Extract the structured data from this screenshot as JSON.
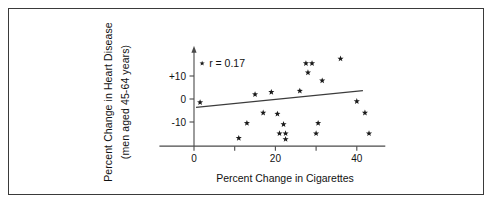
{
  "figure": {
    "xlabel": "Percent Change in Cigarettes",
    "ylabel_line1": "Percent Change in Heart Disease",
    "ylabel_line2": "(men aged 45-64 years)",
    "annotation": "r = 0.17",
    "frame_color": "#3a3a3a",
    "marker_color": "#1a1a1a",
    "axis_color": "#4a4a4a"
  },
  "chart_data": {
    "type": "scatter",
    "title": "",
    "xlabel": "Percent Change in Cigarettes",
    "ylabel": "Percent Change in Heart Disease (men aged 45-64 years)",
    "xlim": [
      -10,
      48
    ],
    "ylim": [
      -22,
      22
    ],
    "xticks": [
      0,
      10,
      20,
      30,
      40
    ],
    "xticklabels": [
      "0",
      "",
      "20",
      "",
      "40"
    ],
    "yticks": [
      -10,
      0,
      10
    ],
    "yticklabels": [
      "-10",
      "0",
      "+10"
    ],
    "grid": false,
    "legend": null,
    "annotations": [
      {
        "text": "r = 0.17",
        "x": 2,
        "y": 15.5,
        "marker": true
      }
    ],
    "series": [
      {
        "name": "countries",
        "marker": "star",
        "points": [
          {
            "x": 1.5,
            "y": -1.5
          },
          {
            "x": 11.0,
            "y": -17.0
          },
          {
            "x": 13.0,
            "y": -10.5
          },
          {
            "x": 15.0,
            "y": 2.0
          },
          {
            "x": 17.0,
            "y": -6.0
          },
          {
            "x": 19.0,
            "y": 3.0
          },
          {
            "x": 20.5,
            "y": -6.5
          },
          {
            "x": 21.0,
            "y": -15.0
          },
          {
            "x": 22.0,
            "y": -11.0
          },
          {
            "x": 22.5,
            "y": -15.0
          },
          {
            "x": 22.5,
            "y": -17.5
          },
          {
            "x": 26.0,
            "y": 3.5
          },
          {
            "x": 27.5,
            "y": 15.5
          },
          {
            "x": 28.0,
            "y": 11.5
          },
          {
            "x": 29.0,
            "y": 15.5
          },
          {
            "x": 30.0,
            "y": -15.0
          },
          {
            "x": 30.5,
            "y": -10.5
          },
          {
            "x": 31.5,
            "y": 8.0
          },
          {
            "x": 36.0,
            "y": 17.5
          },
          {
            "x": 40.0,
            "y": -1.0
          },
          {
            "x": 42.0,
            "y": -6.0
          },
          {
            "x": 43.0,
            "y": -15.0
          }
        ]
      }
    ],
    "fit_line": {
      "name": "regression-line",
      "x0": 0.5,
      "y0": -3.6,
      "x1": 41.5,
      "y1": 3.6
    },
    "correlation": 0.17
  }
}
